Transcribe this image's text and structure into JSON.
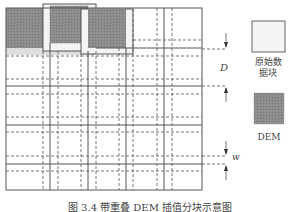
{
  "figure": {
    "caption": "图 3.4  带重叠 DEM 插值分块示意图",
    "grid": {
      "frame": {
        "x": 6,
        "y": 8,
        "w": 196,
        "h": 182
      },
      "solid_vertical_x": [
        50,
        88,
        126,
        164
      ],
      "solid_horizontal_y": [
        48,
        86,
        125,
        164
      ],
      "overlap_offset": 7
    },
    "blocks": [
      {
        "type": "dem",
        "x": 6,
        "y": 8,
        "w": 37,
        "h": 40
      },
      {
        "type": "original",
        "x": 43,
        "y": 4,
        "w": 53,
        "h": 47
      },
      {
        "type": "dem",
        "x": 50,
        "y": 6,
        "w": 38,
        "h": 37
      },
      {
        "type": "original",
        "x": 81,
        "y": 9,
        "w": 52,
        "h": 45
      },
      {
        "type": "dem",
        "x": 88,
        "y": 9,
        "w": 38,
        "h": 39
      }
    ],
    "dimensions": {
      "D": {
        "label": "D",
        "y_top": 49,
        "y_bottom": 86
      },
      "w": {
        "label": "w",
        "y_top": 156,
        "y_bottom": 164
      }
    },
    "colors": {
      "line": "#555555",
      "dem_fill": "#8c8c8c",
      "original_fill": "#f2f2f2",
      "strip": "#dcdcdc"
    }
  },
  "legend": {
    "items": [
      {
        "label_line1": "原始数",
        "label_line2": "据块",
        "kind": "original"
      },
      {
        "label_line1": "DEM",
        "label_line2": "",
        "kind": "dem"
      }
    ]
  }
}
